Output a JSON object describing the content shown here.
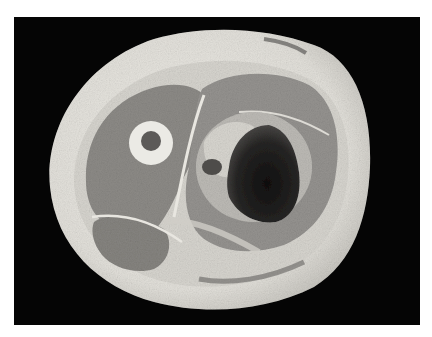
{
  "image": {
    "alt": "Grayscale photograph of a transverse cross-section of a thigh specimen on a black background, showing subcutaneous fat, muscle compartments, the femur with marrow cavity, and a dark hemorrhagic mass within the posterior muscle compartment.",
    "colors": {
      "page_background": "#ffffff",
      "photo_background": "#050505",
      "fat_layer": "#e4e2dc",
      "muscle": "#8e8c88",
      "bone_cortex": "#ecebe6",
      "marrow": "#5a5856",
      "lesion": "#1c1b1a"
    }
  }
}
